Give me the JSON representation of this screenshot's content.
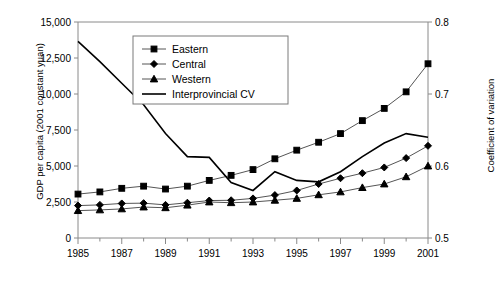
{
  "chart_data": {
    "type": "line",
    "title": "",
    "xlabel": "",
    "ylabel": "GDP per capita (2001 constant yuan)",
    "y2label": "Coefficient of variation",
    "x": [
      1985,
      1986,
      1987,
      1988,
      1989,
      1990,
      1991,
      1992,
      1993,
      1994,
      1995,
      1996,
      1997,
      1998,
      1999,
      2000,
      2001
    ],
    "xticklabels": [
      "1985",
      "1987",
      "1989",
      "1991",
      "1993",
      "1995",
      "1997",
      "1999",
      "2001"
    ],
    "xticks": [
      1985,
      1987,
      1989,
      1991,
      1993,
      1995,
      1997,
      1999,
      2001
    ],
    "xlim": [
      1985,
      2001
    ],
    "ylim": [
      0,
      15000
    ],
    "yticklabels": [
      "0",
      "2,500",
      "5,000",
      "7,500",
      "10,000",
      "12,500",
      "15,000"
    ],
    "yticks": [
      0,
      2500,
      5000,
      7500,
      10000,
      12500,
      15000
    ],
    "y2lim": [
      0.5,
      0.8
    ],
    "y2ticklabels": [
      "0.5",
      "0.6",
      "0.7",
      "0.8"
    ],
    "y2ticks": [
      0.5,
      0.6,
      0.7,
      0.8
    ],
    "grid": false,
    "legend_position": "upper-left-inside",
    "series": [
      {
        "name": "Eastern",
        "marker": "square",
        "axis": "left",
        "values": [
          3050,
          3200,
          3450,
          3600,
          3400,
          3600,
          4000,
          4350,
          4750,
          5500,
          6100,
          6650,
          7250,
          8150,
          9000,
          10150,
          12100
        ]
      },
      {
        "name": "Central",
        "marker": "diamond",
        "axis": "left",
        "values": [
          2250,
          2300,
          2400,
          2420,
          2300,
          2450,
          2600,
          2620,
          2750,
          2980,
          3300,
          3750,
          4150,
          4500,
          4900,
          5550,
          6400
        ]
      },
      {
        "name": "Western",
        "marker": "triangle",
        "axis": "left",
        "values": [
          1900,
          1950,
          2020,
          2150,
          2100,
          2280,
          2500,
          2450,
          2500,
          2620,
          2750,
          3000,
          3200,
          3500,
          3750,
          4250,
          5000
        ]
      },
      {
        "name": "Interprovincial CV",
        "marker": "none",
        "axis": "right",
        "values": [
          0.773,
          0.745,
          0.715,
          0.685,
          0.645,
          0.613,
          0.612,
          0.577,
          0.566,
          0.592,
          0.58,
          0.578,
          0.592,
          0.613,
          0.632,
          0.645,
          0.64
        ]
      }
    ],
    "legend_entries": [
      "Eastern",
      "Central",
      "Western",
      "Interprovincial CV"
    ]
  }
}
